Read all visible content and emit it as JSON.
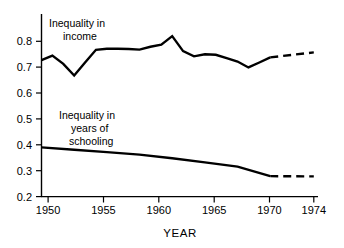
{
  "chart_data": {
    "type": "line",
    "title": "",
    "subtitle": "",
    "xlabel": "YEAR",
    "ylabel": "",
    "xlim": [
      1949,
      1974
    ],
    "ylim": [
      0.2,
      0.85
    ],
    "grid": false,
    "legend_position": "inline-annotation",
    "x_ticks": [
      1950,
      1955,
      1960,
      1965,
      1970,
      1974
    ],
    "x_tick_labels": [
      "1950",
      "1955",
      "1960",
      "1965",
      "1970",
      "1974"
    ],
    "y_ticks": [
      0.2,
      0.3,
      0.4,
      0.5,
      0.6,
      0.7,
      0.8
    ],
    "y_tick_labels": [
      "0.2",
      "0.3",
      "0.4",
      "0.5",
      "0.6",
      "0.7",
      "0.8"
    ],
    "series": [
      {
        "name": "Inequality in income",
        "style": "solid",
        "x": [
          1949,
          1950,
          1951,
          1952,
          1953,
          1954,
          1955,
          1956,
          1957,
          1958,
          1959,
          1960,
          1961,
          1962,
          1963,
          1964,
          1965,
          1966,
          1967,
          1968,
          1969,
          1970
        ],
        "values": [
          0.727,
          0.745,
          0.713,
          0.668,
          0.718,
          0.767,
          0.771,
          0.771,
          0.77,
          0.768,
          0.779,
          0.787,
          0.82,
          0.762,
          0.742,
          0.75,
          0.748,
          0.735,
          0.722,
          0.699,
          0.718,
          0.738
        ]
      },
      {
        "name": "Inequality in income (projected)",
        "style": "dashed",
        "x": [
          1970,
          1974
        ],
        "values": [
          0.738,
          0.757
        ]
      },
      {
        "name": "Inequality in years of schooling",
        "style": "solid",
        "x": [
          1949,
          1952,
          1955,
          1958,
          1961,
          1964,
          1967,
          1970
        ],
        "values": [
          0.39,
          0.381,
          0.372,
          0.362,
          0.348,
          0.332,
          0.316,
          0.279
        ]
      },
      {
        "name": "Inequality in years of schooling (projected)",
        "style": "dashed",
        "x": [
          1970,
          1974
        ],
        "values": [
          0.279,
          0.278
        ]
      }
    ],
    "annotations": [
      {
        "text_line1": "Inequality in",
        "text_line2": "income",
        "target": "income-series"
      },
      {
        "text_line1": "Inequality in",
        "text_line2": "years of",
        "text_line3": "schooling",
        "target": "schooling-series"
      }
    ]
  },
  "labels": {
    "income_line1": "Inequality in",
    "income_line2": "income",
    "schooling_line1": "Inequality in",
    "schooling_line2": "years of",
    "schooling_line3": "schooling",
    "x_axis_title": "YEAR"
  },
  "ticks": {
    "y": [
      "0.8",
      "0.7",
      "0.6",
      "0.5",
      "0.4",
      "0.3",
      "0.2"
    ],
    "x": [
      "1950",
      "1955",
      "1960",
      "1965",
      "1970",
      "1974"
    ]
  },
  "colors": {
    "background": "#ffffff",
    "ink": "#000000"
  }
}
